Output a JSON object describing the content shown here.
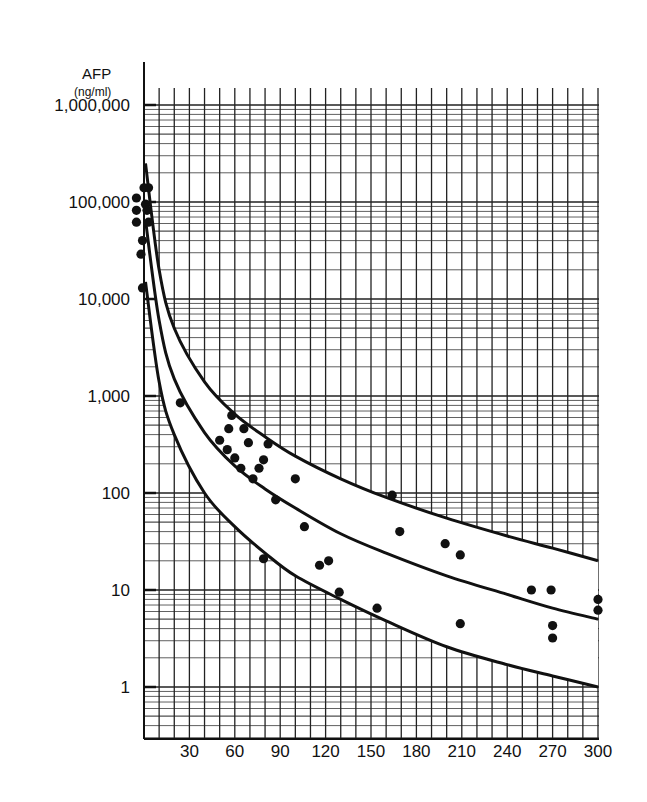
{
  "chart_data": {
    "type": "scatter",
    "title": "",
    "ylabel": "AFP",
    "ylabel_unit": "(ng/ml)",
    "xlabel": "",
    "yscale": "log",
    "ylim": [
      0.5,
      2000000
    ],
    "xlim": [
      0,
      300
    ],
    "grid": true,
    "legend": "none",
    "y_tick_labels": [
      "1,000,000",
      "100,000",
      "10,000",
      "1,000",
      "100",
      "10",
      "1"
    ],
    "y_ticks": [
      1000000,
      100000,
      10000,
      1000,
      100,
      10,
      1
    ],
    "x_tick_labels": [
      "30",
      "60",
      "90",
      "120",
      "150",
      "180",
      "210",
      "240",
      "270",
      "300"
    ],
    "x_ticks": [
      30,
      60,
      90,
      120,
      150,
      180,
      210,
      240,
      270,
      300
    ],
    "series": [
      {
        "name": "upper-limit-curve",
        "kind": "line",
        "points": [
          [
            1,
            250000
          ],
          [
            10,
            20000
          ],
          [
            20,
            5000
          ],
          [
            40,
            1400
          ],
          [
            60,
            650
          ],
          [
            80,
            380
          ],
          [
            100,
            240
          ],
          [
            130,
            140
          ],
          [
            160,
            90
          ],
          [
            200,
            55
          ],
          [
            240,
            36
          ],
          [
            270,
            27
          ],
          [
            300,
            20
          ]
        ]
      },
      {
        "name": "mean-curve",
        "kind": "line",
        "points": [
          [
            1,
            65000
          ],
          [
            10,
            6000
          ],
          [
            20,
            1500
          ],
          [
            40,
            420
          ],
          [
            60,
            190
          ],
          [
            80,
            110
          ],
          [
            100,
            70
          ],
          [
            130,
            38
          ],
          [
            160,
            24
          ],
          [
            200,
            14
          ],
          [
            240,
            9
          ],
          [
            270,
            6.5
          ],
          [
            300,
            5
          ]
        ]
      },
      {
        "name": "lower-limit-curve",
        "kind": "line",
        "points": [
          [
            1,
            15000
          ],
          [
            10,
            1400
          ],
          [
            20,
            400
          ],
          [
            40,
            100
          ],
          [
            60,
            45
          ],
          [
            80,
            24
          ],
          [
            100,
            14
          ],
          [
            130,
            8
          ],
          [
            160,
            4.8
          ],
          [
            200,
            2.6
          ],
          [
            240,
            1.7
          ],
          [
            270,
            1.3
          ],
          [
            300,
            1
          ]
        ]
      },
      {
        "name": "observations",
        "kind": "scatter",
        "points": [
          [
            0,
            140000
          ],
          [
            3,
            140000
          ],
          [
            -5,
            110000
          ],
          [
            1,
            95000
          ],
          [
            -5,
            82000
          ],
          [
            2,
            82000
          ],
          [
            -5,
            62000
          ],
          [
            3,
            62000
          ],
          [
            -1,
            40000
          ],
          [
            -2,
            29000
          ],
          [
            -1,
            13000
          ],
          [
            24,
            850
          ],
          [
            58,
            630
          ],
          [
            56,
            460
          ],
          [
            66,
            460
          ],
          [
            50,
            350
          ],
          [
            69,
            330
          ],
          [
            82,
            320
          ],
          [
            55,
            280
          ],
          [
            60,
            230
          ],
          [
            79,
            220
          ],
          [
            64,
            180
          ],
          [
            76,
            180
          ],
          [
            72,
            140
          ],
          [
            100,
            140
          ],
          [
            87,
            85
          ],
          [
            106,
            45
          ],
          [
            79,
            21
          ],
          [
            116,
            18
          ],
          [
            122,
            20
          ],
          [
            129,
            9.5
          ],
          [
            154,
            6.5
          ],
          [
            164,
            95
          ],
          [
            169,
            40
          ],
          [
            199,
            30
          ],
          [
            209,
            23
          ],
          [
            209,
            4.5
          ],
          [
            256,
            10
          ],
          [
            269,
            10
          ],
          [
            270,
            4.3
          ],
          [
            270,
            3.2
          ],
          [
            300,
            8
          ],
          [
            300,
            6.2
          ]
        ]
      }
    ]
  }
}
